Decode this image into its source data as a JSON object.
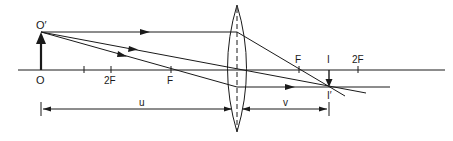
{
  "diagram": {
    "type": "ray-diagram-convex-lens",
    "colors": {
      "ink": "#1a1a1a",
      "background": "#ffffff"
    },
    "labels": {
      "object_top": "O′",
      "object_base": "O",
      "left_2f": "2F",
      "left_f": "F",
      "right_f": "F",
      "image_base": "I",
      "right_2f": "2F",
      "image_top": "I′",
      "object_distance": "u",
      "image_distance": "v"
    }
  }
}
